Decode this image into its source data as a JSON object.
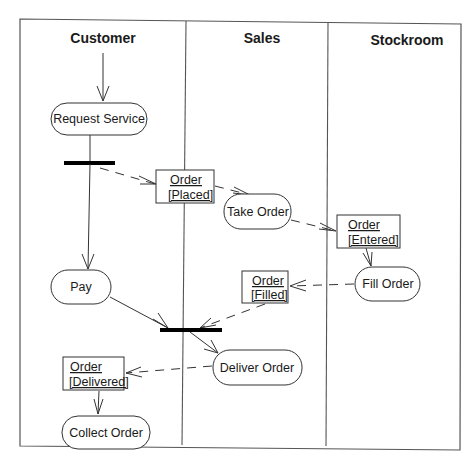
{
  "diagram": {
    "type": "UML activity diagram",
    "swimlanes": [
      {
        "id": "customer",
        "title": "Customer"
      },
      {
        "id": "sales",
        "title": "Sales"
      },
      {
        "id": "stockroom",
        "title": "Stockroom"
      }
    ],
    "activities": {
      "request_service": "Request Service",
      "take_order": "Take Order",
      "fill_order": "Fill Order",
      "pay": "Pay",
      "deliver_order": "Deliver Order",
      "collect_order": "Collect Order"
    },
    "objects": {
      "order_placed": {
        "name": "Order",
        "state": "[Placed]"
      },
      "order_entered": {
        "name": "Order",
        "state": "[Entered]"
      },
      "order_filled": {
        "name": "Order",
        "state": "[Filled]"
      },
      "order_delivered": {
        "name": "Order",
        "state": "[Delivered]"
      }
    },
    "flows": [
      {
        "from": "start",
        "to": "Request Service",
        "kind": "control"
      },
      {
        "from": "Request Service",
        "to": "fork",
        "kind": "control"
      },
      {
        "from": "fork",
        "to": "Order [Placed]",
        "kind": "object"
      },
      {
        "from": "Order [Placed]",
        "to": "Take Order",
        "kind": "object"
      },
      {
        "from": "fork",
        "to": "Pay",
        "kind": "control"
      },
      {
        "from": "Take Order",
        "to": "Order [Entered]",
        "kind": "object"
      },
      {
        "from": "Order [Entered]",
        "to": "Fill Order",
        "kind": "object"
      },
      {
        "from": "Fill Order",
        "to": "Order [Filled]",
        "kind": "object"
      },
      {
        "from": "Order [Filled]",
        "to": "join",
        "kind": "object"
      },
      {
        "from": "Pay",
        "to": "join",
        "kind": "control"
      },
      {
        "from": "join",
        "to": "Deliver Order",
        "kind": "control"
      },
      {
        "from": "Deliver Order",
        "to": "Order [Delivered]",
        "kind": "object"
      },
      {
        "from": "Order [Delivered]",
        "to": "Collect Order",
        "kind": "object"
      }
    ]
  }
}
